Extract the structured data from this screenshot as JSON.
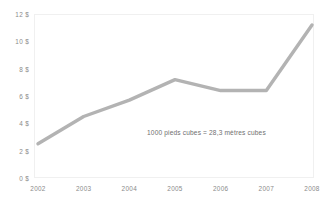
{
  "chart_data": {
    "type": "line",
    "title": "",
    "subtitle": "",
    "xlabel": "",
    "ylabel": "",
    "categories": [
      "2002",
      "2003",
      "2004",
      "2005",
      "2006",
      "2007",
      "2008"
    ],
    "x": [
      2002,
      2003,
      2004,
      2005,
      2006,
      2007,
      2008
    ],
    "values": [
      2.5,
      4.5,
      5.7,
      7.2,
      6.4,
      6.4,
      11.2
    ],
    "series": [
      {
        "name": "",
        "values": [
          2.5,
          4.5,
          5.7,
          7.2,
          6.4,
          6.4,
          11.2
        ],
        "color": "#b3b3b3"
      }
    ],
    "ylim": [
      0,
      12
    ],
    "xlim": [
      2002,
      2008
    ],
    "y_ticks": [
      0,
      2,
      4,
      6,
      8,
      10,
      12
    ],
    "y_tick_labels": [
      "0 $",
      "2 $",
      "4 $",
      "6 $",
      "8 $",
      "10 $",
      "12 $"
    ],
    "x_tick_labels": [
      "2002",
      "2003",
      "2004",
      "2005",
      "2006",
      "2007",
      "2008"
    ],
    "grid": false,
    "legend": null,
    "legend_position": "none",
    "annotations": [
      {
        "text": "1000 pieds cubes = 28,3 mètres cubes",
        "x": 2005,
        "y": 3.2
      }
    ]
  },
  "axes": {
    "y_labels": [
      "12 $",
      "10 $",
      "8 $",
      "6 $",
      "4 $",
      "2 $",
      "0 $"
    ],
    "x_labels": [
      "2002",
      "2003",
      "2004",
      "2005",
      "2006",
      "2007",
      "2008"
    ]
  },
  "annotation": {
    "text": "1000 pieds cubes = 28,3 mètres cubes"
  },
  "colors": {
    "line": "#b3b3b3",
    "tick_text": "#8a8a8a",
    "annotation_text": "#6f6f6f",
    "frame": "#f0f0f0",
    "background": "#ffffff"
  }
}
